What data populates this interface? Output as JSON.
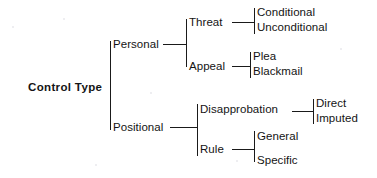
{
  "diagram": {
    "type": "hierarchy-tree",
    "orientation": "left-to-right",
    "root": {
      "label": "Control Type",
      "children": [
        {
          "label": "Personal",
          "children": [
            {
              "label": "Threat",
              "children": [
                {
                  "label": "Conditional",
                  "children": []
                },
                {
                  "label": "Unconditional",
                  "children": []
                }
              ]
            },
            {
              "label": "Appeal",
              "children": [
                {
                  "label": "Plea",
                  "children": []
                },
                {
                  "label": "Blackmail",
                  "children": []
                }
              ]
            }
          ]
        },
        {
          "label": "Positional",
          "children": [
            {
              "label": "Disapprobation",
              "children": [
                {
                  "label": "Direct",
                  "children": []
                },
                {
                  "label": "Imputed",
                  "children": []
                }
              ]
            },
            {
              "label": "Rule",
              "children": [
                {
                  "label": "General",
                  "children": []
                },
                {
                  "label": "Specific",
                  "children": []
                }
              ]
            }
          ]
        }
      ]
    },
    "labels": {
      "root": "Control Type",
      "personal": "Personal",
      "positional": "Positional",
      "threat": "Threat",
      "appeal": "Appeal",
      "disapprobation": "Disapprobation",
      "rule": "Rule",
      "conditional": "Conditional",
      "unconditional": "Unconditional",
      "plea": "Plea",
      "blackmail": "Blackmail",
      "direct": "Direct",
      "imputed": "Imputed",
      "general": "General",
      "specific": "Specific"
    },
    "colors": {
      "background": "#ffffff",
      "line": "#1a1a1a",
      "text": "#141414"
    }
  }
}
